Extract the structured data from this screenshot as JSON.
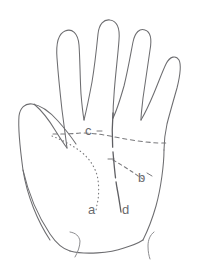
{
  "figure": {
    "name": "hand-palm-crease-diagram",
    "view": "palm",
    "background_color": "#ffffff",
    "outline_color": "#6d6d70",
    "crease_color": "#7a7a7d",
    "label_color": "#6a6a6e"
  },
  "labels": {
    "a": "a",
    "b": "b",
    "c": "c",
    "d": "d"
  },
  "creases": [
    {
      "id": "a",
      "label": "a",
      "style": "dotted",
      "label_x": 88,
      "label_y": 214
    },
    {
      "id": "b",
      "label": "b",
      "style": "dashed",
      "label_x": 138,
      "label_y": 182
    },
    {
      "id": "c",
      "label": "c",
      "style": "dashed",
      "label_x": 85,
      "label_y": 135
    },
    {
      "id": "d",
      "label": "d",
      "style": "solid",
      "label_x": 122,
      "label_y": 214
    }
  ]
}
